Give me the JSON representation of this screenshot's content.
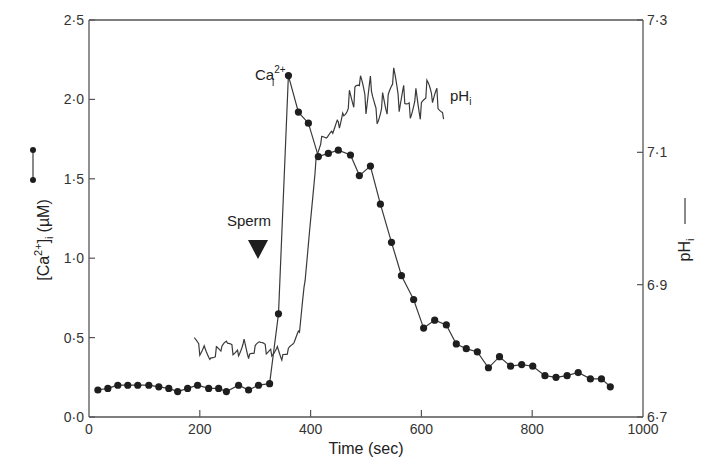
{
  "chart_data": {
    "type": "line",
    "title": "",
    "xlabel": "Time (sec)",
    "ylabel": "[Ca2+]i (µM)",
    "ylabel_right": "pHi",
    "xlim": [
      0,
      1000
    ],
    "ylim": [
      0.0,
      2.5
    ],
    "ylim_right": [
      6.7,
      7.3
    ],
    "x_ticks": [
      0,
      200,
      400,
      600,
      800,
      1000
    ],
    "x_tick_labels": [
      "0",
      "200",
      "400",
      "600",
      "800",
      "1000"
    ],
    "y_ticks": [
      0.0,
      0.5,
      1.0,
      1.5,
      2.0,
      2.5
    ],
    "y_tick_labels": [
      "0·0",
      "0·5",
      "1·0",
      "1·5",
      "2·0",
      "2·5"
    ],
    "y_right_ticks": [
      6.7,
      6.9,
      7.1,
      7.3
    ],
    "y_right_tick_labels": [
      "6·7",
      "6·9",
      "7·1",
      "7·3"
    ],
    "grid": false,
    "annotations": [
      {
        "text": "Sperm",
        "x": 300,
        "marker": "downward-triangle"
      },
      {
        "text": "Ca",
        "sub": "i",
        "sup": "2+",
        "x": 355,
        "y": 2.15,
        "series": "Ca"
      },
      {
        "text": "pH",
        "sub": "i",
        "x": 650,
        "series": "pH"
      }
    ],
    "series": [
      {
        "name": "[Ca2+]i",
        "axis": "left",
        "style": "line-with-dots",
        "x": [
          16,
          34,
          52,
          70,
          88,
          108,
          126,
          144,
          160,
          178,
          196,
          216,
          234,
          248,
          270,
          288,
          306,
          326,
          342,
          360,
          378,
          396,
          414,
          432,
          450,
          472,
          488,
          508,
          526,
          546,
          564,
          586,
          604,
          624,
          645,
          663,
          681,
          701,
          721,
          741,
          761,
          781,
          801,
          823,
          843,
          863,
          883,
          905,
          925,
          941
        ],
        "values": [
          0.17,
          0.18,
          0.2,
          0.2,
          0.2,
          0.2,
          0.19,
          0.18,
          0.16,
          0.18,
          0.2,
          0.18,
          0.18,
          0.16,
          0.2,
          0.17,
          0.2,
          0.21,
          0.65,
          2.15,
          1.92,
          1.85,
          1.64,
          1.66,
          1.68,
          1.65,
          1.52,
          1.58,
          1.34,
          1.1,
          0.89,
          0.74,
          0.56,
          0.61,
          0.58,
          0.46,
          0.43,
          0.41,
          0.31,
          0.38,
          0.32,
          0.33,
          0.32,
          0.26,
          0.25,
          0.26,
          0.28,
          0.24,
          0.24,
          0.19
        ]
      },
      {
        "name": "pHi",
        "axis": "right",
        "style": "noisy-line",
        "x": [
          190,
          200,
          210,
          220,
          230,
          240,
          250,
          260,
          270,
          280,
          290,
          300,
          310,
          320,
          330,
          340,
          350,
          360,
          370,
          380,
          390,
          400,
          410,
          420,
          430,
          440,
          450,
          460,
          470,
          480,
          490,
          500,
          510,
          520,
          530,
          540,
          550,
          560,
          570,
          580,
          590,
          600,
          610,
          620,
          630,
          640
        ],
        "values": [
          6.82,
          6.8,
          6.81,
          6.79,
          6.8,
          6.8,
          6.81,
          6.8,
          6.8,
          6.82,
          6.79,
          6.8,
          6.81,
          6.8,
          6.8,
          6.81,
          6.79,
          6.8,
          6.81,
          6.83,
          6.91,
          7.0,
          7.09,
          7.12,
          7.12,
          7.13,
          7.15,
          7.17,
          7.19,
          7.18,
          7.2,
          7.16,
          7.21,
          7.16,
          7.19,
          7.17,
          7.21,
          7.16,
          7.19,
          7.17,
          7.2,
          7.16,
          7.19,
          7.17,
          7.18,
          7.15
        ]
      }
    ]
  },
  "labels": {
    "x_axis_title": "Time (sec)",
    "y_left_main": "[Ca",
    "y_left_sup": "2+",
    "y_left_close": "]",
    "y_left_sub": "i",
    "y_left_unit": "(µM)",
    "y_right_main": "pH",
    "y_right_sub": "i",
    "sperm": "Sperm",
    "ca_anno_main": "Ca",
    "ca_anno_sup": "2+",
    "ca_anno_sub": "i",
    "ph_anno_main": "pH",
    "ph_anno_sub": "i"
  },
  "colors": {
    "line": "#3a3a3a",
    "dot": "#1e1e1e",
    "axis": "#555555"
  }
}
